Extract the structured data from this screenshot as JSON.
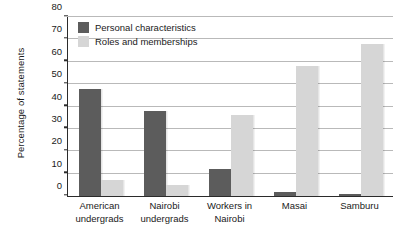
{
  "chart_data": {
    "type": "bar",
    "title": "",
    "subtitle": "",
    "xlabel": "",
    "ylabel": "Percentage of statements",
    "ylim": [
      0,
      80
    ],
    "ytick_step": 10,
    "yticks": [
      "0",
      "10",
      "20",
      "30",
      "40",
      "50",
      "60",
      "70",
      "80"
    ],
    "grid": true,
    "legend_position": "inside top-left",
    "categories": [
      "American undergrads",
      "Nairobi undergrads",
      "Workers in Nairobi",
      "Masai",
      "Samburu"
    ],
    "category_lines": [
      [
        "American",
        "undergrads"
      ],
      [
        "Nairobi",
        "undergrads"
      ],
      [
        "Workers in",
        "Nairobi"
      ],
      [
        "Masai"
      ],
      [
        "Samburu"
      ]
    ],
    "series": [
      {
        "name": "Personal characteristics",
        "color": "#5c5c5c",
        "values": [
          48,
          38,
          12,
          2,
          1
        ]
      },
      {
        "name": "Roles and memberships",
        "color": "#d6d6d6",
        "values": [
          7,
          5,
          36,
          58,
          68
        ]
      }
    ]
  },
  "axis": {
    "y_title": "Percentage of statements"
  },
  "legend": {
    "entries": [
      {
        "label": "Personal characteristics",
        "swatch": "personal"
      },
      {
        "label": "Roles and memberships",
        "swatch": "roles"
      }
    ]
  }
}
